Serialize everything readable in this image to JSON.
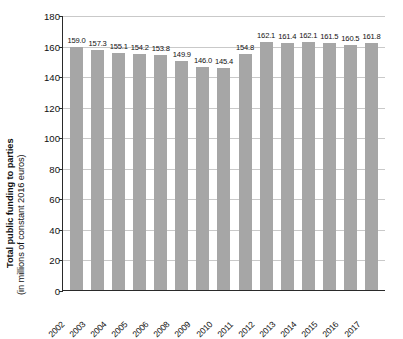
{
  "chart_data": {
    "type": "bar",
    "title": "",
    "xlabel": "",
    "ylabel_bold": "Total public funding to parties",
    "ylabel_sub": "(in millions of constant 2016 euros)",
    "categories": [
      "2002",
      "2003",
      "2004",
      "2005",
      "2006",
      "2008",
      "2009",
      "2010",
      "2011",
      "2012",
      "2013",
      "2014",
      "2015",
      "2016",
      "2017"
    ],
    "values": [
      159.0,
      157.3,
      155.1,
      154.2,
      153.8,
      149.9,
      146.0,
      145.4,
      154.8,
      162.1,
      161.4,
      162.1,
      161.5,
      160.5,
      161.8
    ],
    "value_labels": [
      "159.0",
      "157.3",
      "155.1",
      "154.2",
      "153.8",
      "149.9",
      "146.0",
      "145.4",
      "154.8",
      "162.1",
      "161.4",
      "162.1",
      "161.5",
      "160.5",
      "161.8"
    ],
    "ylim": [
      0,
      180
    ],
    "ytick_values": [
      0,
      20,
      40,
      60,
      80,
      100,
      120,
      140,
      160,
      180
    ],
    "ytick_labels": [
      "0",
      "20",
      "40",
      "60",
      "80",
      "100",
      "120",
      "140",
      "160",
      "180"
    ],
    "grid": true,
    "legend": null,
    "bar_color": "#a6a6a6",
    "grid_color": "#c9c9c9",
    "axis_color": "#2a2a2a",
    "background": "#ffffff"
  }
}
